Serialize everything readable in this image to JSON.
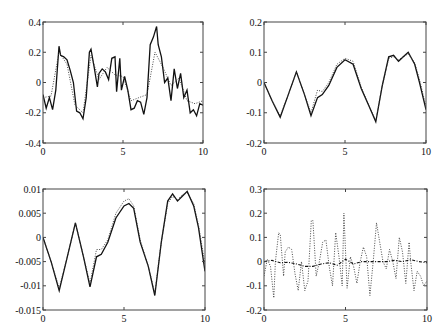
{
  "figure": {
    "layout": "2x2 grid of line plots"
  },
  "chart_data": [
    {
      "type": "line",
      "title": "",
      "xlabel": "",
      "ylabel": "",
      "xlim": [
        0,
        10
      ],
      "ylim": [
        -0.4,
        0.4
      ],
      "xticks": [
        "0",
        "5",
        "10"
      ],
      "yticks": [
        "0.4",
        "0.2",
        "0",
        "-0.2",
        "-0.4"
      ],
      "grid": false,
      "series": [
        {
          "name": "solid",
          "style": "solid",
          "x": [
            0,
            0.2,
            0.4,
            0.6,
            0.8,
            1.0,
            1.1,
            1.3,
            1.5,
            1.7,
            1.9,
            2.1,
            2.3,
            2.5,
            2.7,
            2.9,
            3.0,
            3.2,
            3.4,
            3.5,
            3.7,
            3.9,
            4.1,
            4.3,
            4.5,
            4.6,
            4.8,
            4.9,
            5.1,
            5.3,
            5.5,
            5.7,
            5.9,
            6.1,
            6.3,
            6.5,
            6.7,
            6.9,
            7.1,
            7.2,
            7.4,
            7.6,
            7.8,
            8.0,
            8.2,
            8.4,
            8.6,
            8.8,
            9.0,
            9.2,
            9.4,
            9.6,
            9.8,
            10.0
          ],
          "y": [
            -0.08,
            -0.17,
            -0.1,
            -0.18,
            -0.05,
            0.24,
            0.18,
            0.17,
            0.15,
            0.08,
            0.0,
            -0.19,
            -0.2,
            -0.24,
            -0.1,
            0.2,
            0.22,
            0.1,
            -0.03,
            0.06,
            0.09,
            0.07,
            0.02,
            0.16,
            0.17,
            -0.06,
            0.16,
            -0.05,
            0.04,
            -0.05,
            -0.18,
            -0.17,
            -0.12,
            -0.13,
            -0.21,
            -0.1,
            0.25,
            0.3,
            0.37,
            0.25,
            0.17,
            0.0,
            0.03,
            -0.12,
            0.09,
            -0.04,
            0.06,
            -0.1,
            -0.05,
            -0.2,
            -0.18,
            -0.22,
            -0.14,
            -0.15
          ]
        },
        {
          "name": "dotted",
          "style": "dotted",
          "x": [
            0,
            0.5,
            1.0,
            1.5,
            2.0,
            2.5,
            3.0,
            3.5,
            4.0,
            4.5,
            5.0,
            5.5,
            6.0,
            6.5,
            7.0,
            7.5,
            8.0,
            8.5,
            9.0,
            9.5,
            10.0
          ],
          "y": [
            -0.1,
            -0.09,
            0.2,
            0.12,
            -0.15,
            -0.2,
            0.18,
            0.02,
            0.1,
            0.05,
            0.04,
            -0.12,
            -0.1,
            -0.08,
            0.2,
            0.1,
            -0.02,
            0.03,
            -0.12,
            -0.14,
            -0.12
          ]
        }
      ]
    },
    {
      "type": "line",
      "title": "",
      "xlabel": "",
      "ylabel": "",
      "xlim": [
        0,
        10
      ],
      "ylim": [
        -0.2,
        0.2
      ],
      "xticks": [
        "0",
        "5",
        "10"
      ],
      "yticks": [
        "0.2",
        "0.1",
        "0",
        "-0.1",
        "-0.2"
      ],
      "grid": false,
      "series": [
        {
          "name": "solid",
          "style": "solid",
          "x": [
            0,
            0.5,
            1.0,
            1.5,
            2.0,
            2.5,
            2.9,
            3.3,
            3.6,
            4.0,
            4.5,
            5.0,
            5.5,
            6.0,
            6.5,
            6.9,
            7.3,
            7.7,
            8.0,
            8.3,
            8.6,
            8.9,
            9.3,
            9.6,
            10.0
          ],
          "y": [
            0.0,
            -0.06,
            -0.115,
            -0.04,
            0.035,
            -0.04,
            -0.11,
            -0.05,
            -0.04,
            -0.01,
            0.05,
            0.075,
            0.06,
            -0.02,
            -0.08,
            -0.13,
            -0.01,
            0.085,
            0.09,
            0.07,
            0.085,
            0.1,
            0.06,
            0.0,
            -0.09
          ]
        },
        {
          "name": "dotted",
          "style": "dotted",
          "x": [
            0,
            0.5,
            1.0,
            1.5,
            2.0,
            2.5,
            2.9,
            3.3,
            3.6,
            4.0,
            4.5,
            5.0,
            5.5,
            6.0,
            6.5,
            6.9,
            7.3,
            7.7,
            8.0,
            8.3,
            8.6,
            8.9,
            9.3,
            9.6,
            10.0
          ],
          "y": [
            0.0,
            -0.06,
            -0.11,
            -0.04,
            0.035,
            -0.04,
            -0.1,
            -0.025,
            -0.03,
            0.0,
            0.06,
            0.08,
            0.07,
            -0.015,
            -0.08,
            -0.125,
            -0.01,
            0.08,
            0.085,
            0.075,
            0.085,
            0.095,
            0.065,
            0.01,
            -0.08
          ]
        }
      ]
    },
    {
      "type": "line",
      "title": "",
      "xlabel": "",
      "ylabel": "",
      "xlim": [
        0,
        10
      ],
      "ylim": [
        -0.015,
        0.01
      ],
      "xticks": [
        "0",
        "5",
        "10"
      ],
      "yticks": [
        "0.01",
        "0.005",
        "0",
        "-0.005",
        "-0.01",
        "-0.015"
      ],
      "grid": false,
      "series": [
        {
          "name": "solid",
          "style": "solid",
          "x": [
            0,
            0.5,
            1.0,
            1.5,
            2.0,
            2.5,
            2.9,
            3.3,
            3.6,
            4.0,
            4.5,
            5.0,
            5.3,
            5.6,
            6.0,
            6.5,
            6.9,
            7.3,
            7.7,
            8.0,
            8.3,
            8.6,
            8.9,
            9.3,
            9.6,
            10.0
          ],
          "y": [
            0.0,
            -0.005,
            -0.011,
            -0.004,
            0.003,
            -0.004,
            -0.0102,
            -0.004,
            -0.0035,
            -0.001,
            0.004,
            0.0065,
            0.007,
            0.006,
            -0.001,
            -0.006,
            -0.012,
            -0.001,
            0.0075,
            0.009,
            0.0075,
            0.0085,
            0.0095,
            0.0065,
            0.002,
            -0.007
          ]
        },
        {
          "name": "dotted",
          "style": "dotted",
          "x": [
            0,
            0.5,
            1.0,
            1.5,
            2.0,
            2.5,
            2.9,
            3.3,
            3.6,
            4.0,
            4.5,
            5.0,
            5.3,
            5.6,
            6.0,
            6.5,
            6.9,
            7.3,
            7.7,
            8.0,
            8.3,
            8.6,
            8.9,
            9.3,
            9.6,
            10.0
          ],
          "y": [
            0.0,
            -0.005,
            -0.0105,
            -0.004,
            0.003,
            -0.004,
            -0.0095,
            -0.0025,
            -0.0025,
            -0.0005,
            0.005,
            0.0075,
            0.008,
            0.0065,
            -0.0005,
            -0.006,
            -0.0115,
            -0.001,
            0.007,
            0.0085,
            0.0078,
            0.0088,
            0.0092,
            0.007,
            0.0025,
            -0.0055
          ]
        }
      ]
    },
    {
      "type": "line",
      "title": "",
      "xlabel": "",
      "ylabel": "",
      "xlim": [
        0,
        10
      ],
      "ylim": [
        -0.2,
        0.3
      ],
      "xticks": [
        "0",
        "5",
        "10"
      ],
      "yticks": [
        "0.3",
        "0.2",
        "0.1",
        "0",
        "-0.1",
        "-0.2"
      ],
      "grid": false,
      "series": [
        {
          "name": "dotted",
          "style": "dotted",
          "x": [
            0,
            0.2,
            0.4,
            0.6,
            0.7,
            0.9,
            1.0,
            1.2,
            1.3,
            1.5,
            1.7,
            1.9,
            2.1,
            2.3,
            2.5,
            2.7,
            2.9,
            3.0,
            3.2,
            3.4,
            3.6,
            3.8,
            4.0,
            4.2,
            4.4,
            4.6,
            4.8,
            4.9,
            5.1,
            5.3,
            5.5,
            5.7,
            5.9,
            6.1,
            6.3,
            6.5,
            6.7,
            6.9,
            7.1,
            7.3,
            7.5,
            7.7,
            7.9,
            8.1,
            8.3,
            8.5,
            8.7,
            8.9,
            9.0,
            9.2,
            9.4,
            9.6,
            9.8,
            10.0
          ],
          "y": [
            -0.06,
            0.01,
            -0.02,
            -0.15,
            0.0,
            0.12,
            0.11,
            -0.06,
            0.04,
            0.06,
            0.05,
            -0.05,
            -0.12,
            0.0,
            -0.12,
            -0.08,
            0.17,
            0.17,
            -0.06,
            0.0,
            0.08,
            0.09,
            -0.02,
            -0.1,
            0.12,
            0.02,
            -0.1,
            0.2,
            -0.11,
            0.02,
            -0.02,
            -0.09,
            0.0,
            0.06,
            0.02,
            -0.14,
            0.0,
            0.16,
            0.08,
            0.0,
            -0.03,
            0.05,
            0.0,
            -0.07,
            0.1,
            0.04,
            -0.09,
            0.08,
            0.0,
            -0.12,
            -0.04,
            -0.06,
            -0.1,
            -0.08
          ]
        },
        {
          "name": "dash-dot",
          "style": "dashdot",
          "x": [
            0,
            0.5,
            1.0,
            1.5,
            2.0,
            2.5,
            3.0,
            3.5,
            4.0,
            4.5,
            5.0,
            5.5,
            6.0,
            6.5,
            7.0,
            7.5,
            8.0,
            8.5,
            9.0,
            9.5,
            10.0
          ],
          "y": [
            0.0,
            0.005,
            -0.005,
            -0.003,
            -0.01,
            -0.02,
            -0.02,
            -0.01,
            -0.005,
            -0.015,
            0.01,
            -0.01,
            0.0,
            0.0,
            0.0,
            0.0,
            0.005,
            0.0,
            0.008,
            0.0,
            -0.005
          ]
        }
      ]
    }
  ]
}
